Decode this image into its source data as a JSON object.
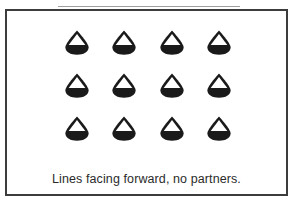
{
  "figure": {
    "kind": "diagram",
    "caption": "Lines facing forward, no partners.",
    "colors": {
      "frame_border": "#3c3c3c",
      "figure_fill": "#1a1a1a",
      "figure_notch": "#ffffff",
      "background": "#ffffff",
      "caption_text": "#2b2b2b",
      "top_rule": "#8d8d8d"
    }
  },
  "diagram_data": {
    "type": "formation-grid",
    "rows": 3,
    "columns": 4,
    "total_figures": 12,
    "figure_icon": "dancer-facing-forward-icon",
    "orientation": "all figures facing forward (toward viewer / front of room)",
    "pairing": "none",
    "grid": [
      {
        "row_label": "row-1",
        "figures": [
          {
            "icon": "dancer-facing-forward-icon",
            "facing": "forward"
          },
          {
            "icon": "dancer-facing-forward-icon",
            "facing": "forward"
          },
          {
            "icon": "dancer-facing-forward-icon",
            "facing": "forward"
          },
          {
            "icon": "dancer-facing-forward-icon",
            "facing": "forward"
          }
        ]
      },
      {
        "row_label": "row-2",
        "figures": [
          {
            "icon": "dancer-facing-forward-icon",
            "facing": "forward"
          },
          {
            "icon": "dancer-facing-forward-icon",
            "facing": "forward"
          },
          {
            "icon": "dancer-facing-forward-icon",
            "facing": "forward"
          },
          {
            "icon": "dancer-facing-forward-icon",
            "facing": "forward"
          }
        ]
      },
      {
        "row_label": "row-3",
        "figures": [
          {
            "icon": "dancer-facing-forward-icon",
            "facing": "forward"
          },
          {
            "icon": "dancer-facing-forward-icon",
            "facing": "forward"
          },
          {
            "icon": "dancer-facing-forward-icon",
            "facing": "forward"
          },
          {
            "icon": "dancer-facing-forward-icon",
            "facing": "forward"
          }
        ]
      }
    ]
  }
}
